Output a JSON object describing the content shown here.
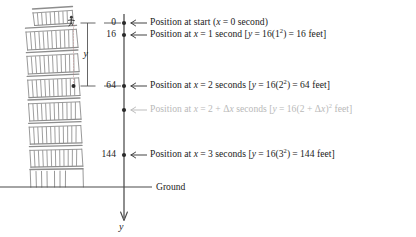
{
  "figure": {
    "axis_label": "y",
    "ground_label": "Ground",
    "brace_label": "y",
    "colors": {
      "ink": "#222222",
      "tower": "#8d8d8d",
      "axis": "#4a4a4a",
      "faded_text": "#b9b9b9",
      "background": "#ffffff"
    }
  },
  "axis": {
    "ticks": [
      {
        "value": "0",
        "y": 23,
        "labeled": true
      },
      {
        "value": "16",
        "y": 35,
        "labeled": true
      },
      {
        "value": "64",
        "y": 86,
        "labeled": true
      },
      {
        "value": "",
        "y": 110,
        "labeled": false
      },
      {
        "value": "144",
        "y": 155,
        "labeled": true
      }
    ],
    "ground_y": 187
  },
  "annotations": [
    {
      "id": "start",
      "y": 23,
      "faded": false,
      "text": "Position at start (x = 0 second)",
      "parts": [
        {
          "t": "Position at start (",
          "k": "plain"
        },
        {
          "t": "x",
          "k": "it"
        },
        {
          "t": "=",
          "k": "eq"
        },
        {
          "t": "0 second)",
          "k": "plain"
        }
      ]
    },
    {
      "id": "t1",
      "y": 35,
      "faded": false,
      "text": "Position at x = 1 second [y = 16(1²) = 16 feet]",
      "parts": [
        {
          "t": "Position at ",
          "k": "plain"
        },
        {
          "t": "x",
          "k": "it"
        },
        {
          "t": "=",
          "k": "eq"
        },
        {
          "t": "1 second [",
          "k": "plain"
        },
        {
          "t": "y",
          "k": "it"
        },
        {
          "t": "=",
          "k": "eq"
        },
        {
          "t": "16(1",
          "k": "plain"
        },
        {
          "t": "2",
          "k": "sup"
        },
        {
          "t": ")",
          "k": "plain"
        },
        {
          "t": "=",
          "k": "eq"
        },
        {
          "t": "16 feet]",
          "k": "plain"
        }
      ]
    },
    {
      "id": "t2",
      "y": 86,
      "faded": false,
      "text": "Position at x = 2 seconds [y = 16(2²) = 64 feet]",
      "parts": [
        {
          "t": "Position at ",
          "k": "plain"
        },
        {
          "t": "x",
          "k": "it"
        },
        {
          "t": "=",
          "k": "eq"
        },
        {
          "t": "2 seconds [",
          "k": "plain"
        },
        {
          "t": "y",
          "k": "it"
        },
        {
          "t": "=",
          "k": "eq"
        },
        {
          "t": "16(2",
          "k": "plain"
        },
        {
          "t": "2",
          "k": "sup"
        },
        {
          "t": ")",
          "k": "plain"
        },
        {
          "t": "=",
          "k": "eq"
        },
        {
          "t": "64 feet]",
          "k": "plain"
        }
      ]
    },
    {
      "id": "t2dx",
      "y": 110,
      "faded": true,
      "text": "Position at x = 2 + Δx seconds [y = 16(2 + Δx)² feet]",
      "parts": [
        {
          "t": "Position at ",
          "k": "plain"
        },
        {
          "t": "x",
          "k": "it"
        },
        {
          "t": "=",
          "k": "eq"
        },
        {
          "t": "2 + Δ",
          "k": "plain"
        },
        {
          "t": "x",
          "k": "it"
        },
        {
          "t": " seconds [",
          "k": "plain"
        },
        {
          "t": "y",
          "k": "it"
        },
        {
          "t": "=",
          "k": "eq"
        },
        {
          "t": "16(2 + Δ",
          "k": "plain"
        },
        {
          "t": "x",
          "k": "it"
        },
        {
          "t": ")",
          "k": "plain"
        },
        {
          "t": "2",
          "k": "sup"
        },
        {
          "t": " feet]",
          "k": "plain"
        }
      ]
    },
    {
      "id": "t3",
      "y": 155,
      "faded": false,
      "text": "Position at x = 3 seconds [y = 16(3²) = 144 feet]",
      "parts": [
        {
          "t": "Position at ",
          "k": "plain"
        },
        {
          "t": "x",
          "k": "it"
        },
        {
          "t": "=",
          "k": "eq"
        },
        {
          "t": "3 seconds [",
          "k": "plain"
        },
        {
          "t": "y",
          "k": "it"
        },
        {
          "t": "=",
          "k": "eq"
        },
        {
          "t": "16(3",
          "k": "plain"
        },
        {
          "t": "2",
          "k": "sup"
        },
        {
          "t": ")",
          "k": "plain"
        },
        {
          "t": "=",
          "k": "eq"
        },
        {
          "t": "144 feet]",
          "k": "plain"
        }
      ]
    }
  ],
  "chart_data": {
    "type": "scatter",
    "title": "",
    "xlabel": "",
    "ylabel": "y",
    "x": [
      0,
      1,
      2,
      3
    ],
    "values": [
      0,
      16,
      64,
      144
    ],
    "tick_labels": [
      "0",
      "16",
      "64",
      "144"
    ],
    "extra_point_label": "2 + Δx",
    "ylim": [
      0,
      187
    ],
    "grid": false,
    "legend": "none"
  }
}
